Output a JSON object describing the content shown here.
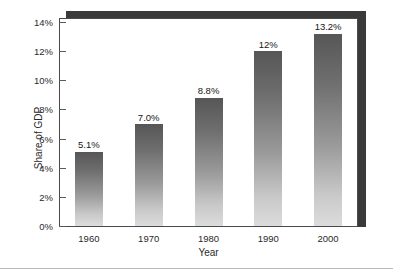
{
  "chart_data": {
    "type": "bar",
    "title": "",
    "xlabel": "Year",
    "ylabel": "Share of GDP",
    "categories": [
      "1960",
      "1970",
      "1980",
      "1990",
      "2000"
    ],
    "values": [
      5.1,
      7.0,
      8.8,
      12.0,
      13.2
    ],
    "data_labels": [
      "5.1%",
      "7.0%",
      "8.8%",
      "12%",
      "13.2%"
    ],
    "ylim": [
      0,
      14
    ],
    "ytick_values": [
      0,
      2,
      4,
      6,
      8,
      10,
      12,
      14
    ],
    "ytick_labels": [
      "0%",
      "2%",
      "4%",
      "6%",
      "8%",
      "10%",
      "12%",
      "14%"
    ],
    "grid": false,
    "legend": null,
    "bar_color_top": "#565656",
    "bar_color_bottom": "#dcdcdc",
    "frame_color": "#4a4a4a",
    "shadow_color": "#3a3a3a"
  }
}
